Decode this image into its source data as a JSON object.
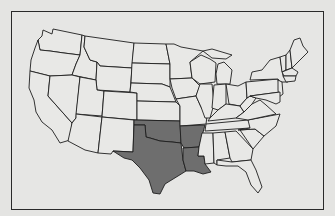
{
  "map": {
    "subject": "Contiguous United States",
    "highlight_color": "#6e6e6e",
    "base_color": "#e8e8e6",
    "border_color": "#1e1e1e",
    "highlighted_states": [
      "Texas",
      "Oklahoma",
      "Arkansas",
      "Louisiana"
    ]
  }
}
